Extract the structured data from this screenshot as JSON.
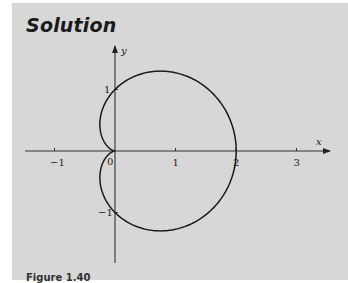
{
  "heading": {
    "title": "Solution"
  },
  "caption": {
    "text": "Figure 1.40"
  },
  "colors": {
    "panel_background": "#d7d7d7",
    "curve": "#1a1a1a",
    "axes": "#333333"
  },
  "chart_data": {
    "type": "line",
    "title": "Solution",
    "xlabel": "x",
    "ylabel": "y",
    "xlim": [
      -1.5,
      3.5
    ],
    "ylim": [
      -1.8,
      1.7
    ],
    "x_ticks": [
      -1,
      1,
      2,
      3
    ],
    "x_tick_labels": [
      "−1",
      "1",
      "2",
      "3"
    ],
    "y_ticks": [
      1,
      -1
    ],
    "y_tick_labels": [
      "1",
      "−1"
    ],
    "origin_label": "0",
    "grid": false,
    "legend": null,
    "series": [
      {
        "name": "r = 1 + cos θ",
        "points": [
          [
            2.0,
            0.0
          ],
          [
            1.87,
            0.5
          ],
          [
            1.5,
            0.87
          ],
          [
            1.0,
            1.15
          ],
          [
            0.75,
            1.3
          ],
          [
            0.5,
            1.3
          ],
          [
            0.0,
            1.0
          ],
          [
            -0.25,
            0.43
          ],
          [
            -0.2,
            0.15
          ],
          [
            0.0,
            0.0
          ],
          [
            -0.2,
            -0.15
          ],
          [
            -0.25,
            -0.43
          ],
          [
            0.0,
            -1.0
          ],
          [
            0.5,
            -1.3
          ],
          [
            0.75,
            -1.3
          ],
          [
            1.0,
            -1.15
          ],
          [
            1.5,
            -0.87
          ],
          [
            1.87,
            -0.5
          ],
          [
            2.0,
            0.0
          ]
        ]
      }
    ]
  }
}
